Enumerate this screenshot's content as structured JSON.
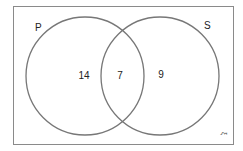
{
  "diagram": {
    "type": "venn",
    "universal_symbol": "ξ",
    "sets": [
      {
        "label": "P",
        "only": "14"
      },
      {
        "label": "S",
        "only": "9"
      }
    ],
    "intersection": "7",
    "colors": {
      "border": "#888888",
      "circle": "#777777",
      "text": "#222222"
    }
  }
}
